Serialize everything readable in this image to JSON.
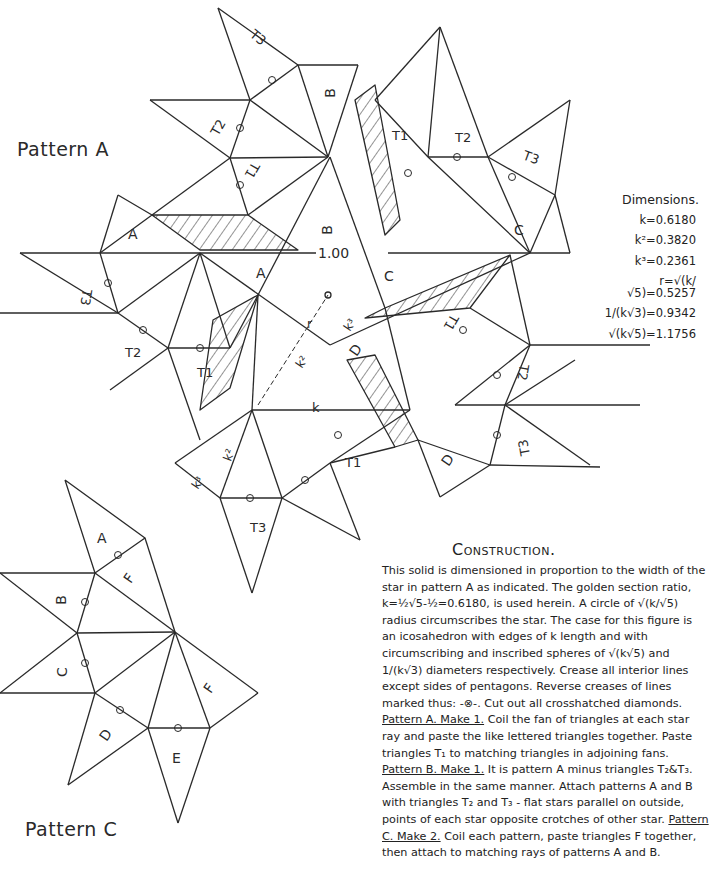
{
  "patterns": {
    "a": {
      "title": "Pattern A",
      "width_label": "1.00"
    },
    "c": {
      "title": "Pattern C"
    }
  },
  "triangle_labels": {
    "pattern_a": [
      "A",
      "A",
      "A",
      "B",
      "B",
      "C",
      "C",
      "C",
      "D",
      "D",
      "D",
      "T1",
      "T1",
      "T1",
      "T1",
      "T1",
      "T2",
      "T2",
      "T2",
      "T2",
      "T3",
      "T3",
      "T3",
      "T3",
      "T3"
    ],
    "pattern_c": [
      "A",
      "B",
      "C",
      "D",
      "E",
      "F",
      "F"
    ]
  },
  "measure_labels": {
    "k": "k",
    "k2": "k²",
    "k3": "k³",
    "r": "r"
  },
  "dimensions": {
    "title": "Dimensions.",
    "rows": [
      {
        "label": "k=0.6180"
      },
      {
        "label": "k²=0.3820"
      },
      {
        "label": "k³=0.2361"
      },
      {
        "label": "r=√(k/√5)=0.5257"
      },
      {
        "label": "1/(k√3)=0.9342"
      },
      {
        "label": "√(k√5)=1.1756"
      }
    ]
  },
  "construction": {
    "title": "Construction.",
    "p1": "This solid is dimensioned in proportion to the width of the star in pattern A as indicated. The golden section ratio, k=½√5-½=0.6180, is used herein. A circle of √(k/√5) radius circumscribes the star. The case for this figure is an icosahedron with edges of k length and with circumscribing and inscribed spheres of √(k√5) and 1/(k√3) diameters respectively. Crease all interior lines except sides of pentagons. Reverse creases of lines marked thus: -⊗-. Cut out all crosshatched diamonds.",
    "a_head": "Pattern A. Make 1.",
    "a_body": " Coil the fan of triangles at each star ray and paste the like lettered triangles together. Paste triangles T₁ to matching triangles in adjoining fans.",
    "b_head": "Pattern B. Make 1.",
    "b_body": " It is pattern A minus triangles T₂&T₃. Assemble in the same manner. Attach patterns A and B with triangles T₂ and T₃ - flat stars parallel on outside, points of each star opposite crotches of other star.",
    "c_head": "Pattern C. Make 2.",
    "c_body": " Coil each pattern, paste triangles F together, then attach to matching rays of patterns A and B."
  },
  "colors": {
    "line": "#2a2a2a",
    "paper": "#ffffff"
  }
}
